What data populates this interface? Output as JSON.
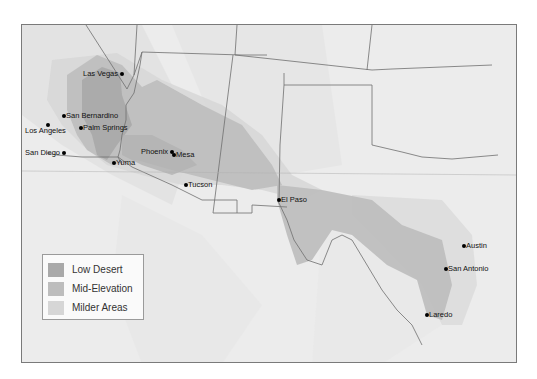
{
  "map": {
    "colors": {
      "background": "#efefef",
      "low_desert": "#a9a9a9",
      "mid_elevation": "#bdbdbd",
      "milder_areas": "#d6d6d6",
      "border": "#6e6e6e"
    },
    "cities": [
      {
        "name": "Las Vegas",
        "label_side": "left"
      },
      {
        "name": "San Bernardino",
        "label_side": "right"
      },
      {
        "name": "Los Angeles",
        "label_side": "below"
      },
      {
        "name": "Palm Springs",
        "label_side": "right"
      },
      {
        "name": "San Diego",
        "label_side": "left"
      },
      {
        "name": "Yuma",
        "label_side": "right"
      },
      {
        "name": "Phoenix",
        "label_side": "left"
      },
      {
        "name": "Mesa",
        "label_side": "right"
      },
      {
        "name": "Tucson",
        "label_side": "right"
      },
      {
        "name": "El Paso",
        "label_side": "right"
      },
      {
        "name": "Austin",
        "label_side": "right"
      },
      {
        "name": "San Antonio",
        "label_side": "right"
      },
      {
        "name": "Laredo",
        "label_side": "right"
      }
    ]
  },
  "legend": {
    "items": [
      {
        "label": "Low Desert",
        "color": "#a9a9a9"
      },
      {
        "label": "Mid-Elevation",
        "color": "#bdbdbd"
      },
      {
        "label": "Milder Areas",
        "color": "#d6d6d6"
      }
    ]
  }
}
